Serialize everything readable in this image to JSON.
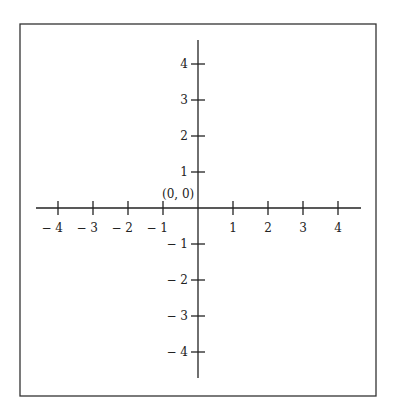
{
  "diagram": {
    "origin_label": "(0, 0)",
    "x_ticks": [
      {
        "value": -4,
        "label": "− 4"
      },
      {
        "value": -3,
        "label": "− 3"
      },
      {
        "value": -2,
        "label": "− 2"
      },
      {
        "value": -1,
        "label": "− 1"
      },
      {
        "value": 1,
        "label": "1"
      },
      {
        "value": 2,
        "label": "2"
      },
      {
        "value": 3,
        "label": "3"
      },
      {
        "value": 4,
        "label": "4"
      }
    ],
    "y_ticks": [
      {
        "value": 4,
        "label": "4"
      },
      {
        "value": 3,
        "label": "3"
      },
      {
        "value": 2,
        "label": "2"
      },
      {
        "value": 1,
        "label": "1"
      },
      {
        "value": -1,
        "label": "− 1"
      },
      {
        "value": -2,
        "label": "− 2"
      },
      {
        "value": -3,
        "label": "− 3"
      },
      {
        "value": -4,
        "label": "− 4"
      }
    ],
    "colors": {
      "axis": "#222222",
      "border": "#333333",
      "background": "#ffffff"
    }
  }
}
